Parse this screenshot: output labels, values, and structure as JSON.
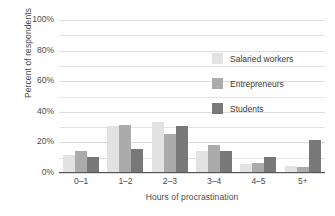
{
  "chart_data": {
    "type": "bar",
    "title": "",
    "xlabel": "Hours of procrastination",
    "ylabel": "Percent of respondents",
    "categories": [
      "0–1",
      "1–2",
      "2–3",
      "3–4",
      "4–5",
      "5+"
    ],
    "series": [
      {
        "name": "Salaried workers",
        "color": "#e2e2e2",
        "values": [
          11,
          30,
          33,
          14,
          5,
          4
        ]
      },
      {
        "name": "Entrepreneurs",
        "color": "#ababab",
        "values": [
          14,
          31,
          25,
          18,
          6,
          3
        ]
      },
      {
        "name": "Students",
        "color": "#787878",
        "values": [
          10,
          15,
          30,
          14,
          10,
          21
        ]
      }
    ],
    "ylim": [
      0,
      100
    ],
    "yticks": [
      0,
      20,
      40,
      60,
      80,
      100
    ],
    "ytick_labels": [
      "0%",
      "20%",
      "40%",
      "60%",
      "80%",
      "100%"
    ],
    "minor_gridlines": [
      10,
      30,
      50,
      70,
      90
    ],
    "grid": true,
    "legend_position": "upper right"
  },
  "axis": {
    "y_title": "Percent of respondents",
    "x_title": "Hours of procrastination"
  }
}
